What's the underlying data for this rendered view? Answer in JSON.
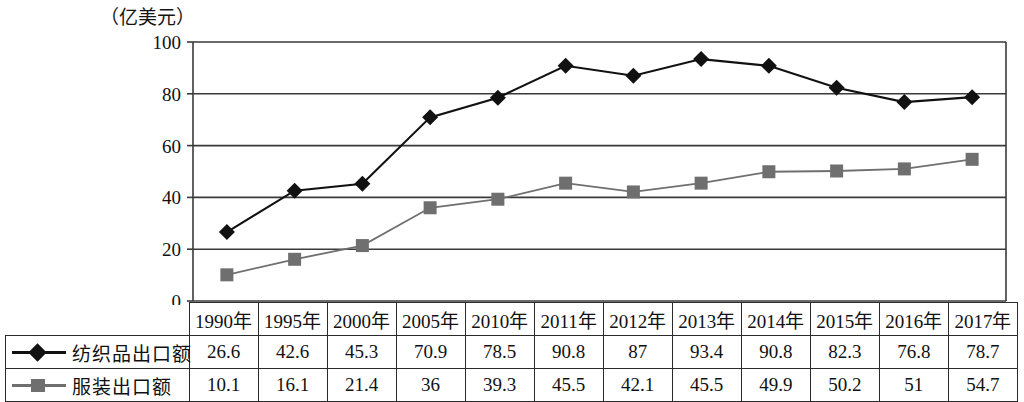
{
  "axis": {
    "unit_label": "（亿美元）",
    "y_ticks": [
      "0",
      "20",
      "40",
      "60",
      "80",
      "100"
    ]
  },
  "legend": {
    "series1_label": "纺织品出口额",
    "series1_marker": "diamond-marker-icon",
    "series2_label": "服装出口额",
    "series2_marker": "square-marker-icon"
  },
  "colors": {
    "series1": "#111111",
    "series2": "#6f6f6f",
    "grid": "#3a3a3a",
    "border": "#2a2a2a"
  },
  "chart_data": {
    "type": "line",
    "title": "",
    "xlabel": "",
    "ylabel": "亿美元",
    "ylim": [
      0,
      100
    ],
    "yticks": [
      0,
      20,
      40,
      60,
      80,
      100
    ],
    "grid": true,
    "legend_position": "table-left",
    "categories": [
      "1990年",
      "1995年",
      "2000年",
      "2005年",
      "2010年",
      "2011年",
      "2012年",
      "2013年",
      "2014年",
      "2015年",
      "2016年",
      "2017年"
    ],
    "series": [
      {
        "name": "纺织品出口额",
        "marker": "diamond",
        "color": "#111111",
        "values": [
          26.6,
          42.6,
          45.3,
          70.9,
          78.5,
          90.8,
          87,
          93.4,
          90.8,
          82.3,
          76.8,
          78.7
        ],
        "value_labels": [
          "26.6",
          "42.6",
          "45.3",
          "70.9",
          "78.5",
          "90.8",
          "87",
          "93.4",
          "90.8",
          "82.3",
          "76.8",
          "78.7"
        ]
      },
      {
        "name": "服装出口额",
        "marker": "square",
        "color": "#6f6f6f",
        "values": [
          10.1,
          16.1,
          21.4,
          36,
          39.3,
          45.5,
          42.1,
          45.5,
          49.9,
          50.2,
          51,
          54.7
        ],
        "value_labels": [
          "10.1",
          "16.1",
          "21.4",
          "36",
          "39.3",
          "45.5",
          "42.1",
          "45.5",
          "49.9",
          "50.2",
          "51",
          "54.7"
        ]
      }
    ]
  }
}
